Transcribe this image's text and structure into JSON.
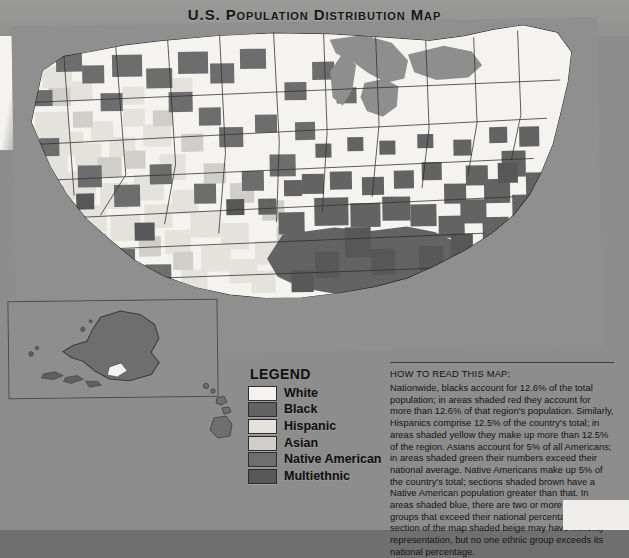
{
  "page": {
    "title": "U.S. Population Distribution Map"
  },
  "legend": {
    "heading": "LEGEND",
    "items": [
      {
        "label": "White",
        "color": "#f4f3ef"
      },
      {
        "label": "Black",
        "color": "#636363"
      },
      {
        "label": "Hispanic",
        "color": "#e3e2dc"
      },
      {
        "label": "Asian",
        "color": "#cfcec8"
      },
      {
        "label": "Native American",
        "color": "#6e6e6e"
      },
      {
        "label": "Multiethnic",
        "color": "#585858"
      }
    ]
  },
  "howto": {
    "heading": "HOW TO READ THIS MAP:",
    "body": "Nationwide, blacks account for 12.6% of the total population; in areas shaded red they account for more than 12.6% of that region's population. Similarly, Hispanics comprise 12.5% of the country's total; in areas shaded yellow they make up more than 12.5% of the region. Asians account for 5% of all Americans; in areas shaded green their numbers exceed their national average. Native Americans make up 5% of the country's total; sections shaded brown have a Native American population greater than that. In areas shaded blue, there are two or more minority groups that exceed their national percentage. The section of the map shaded beige may have minority representation, but no one ethnic group exceeds its national percentage."
  },
  "map": {
    "name": "united-states-choropleth",
    "insets": [
      {
        "name": "alaska-inset"
      },
      {
        "name": "hawaii-inset"
      }
    ],
    "palette": {
      "land_base": "#f4f3ef",
      "hispanic": "#e3e2dc",
      "asian": "#cfcec8",
      "black": "#636363",
      "native_american": "#6e6e6e",
      "multiethnic": "#585858",
      "water": "#8f8f8f",
      "border": "#2f2f2f"
    }
  }
}
